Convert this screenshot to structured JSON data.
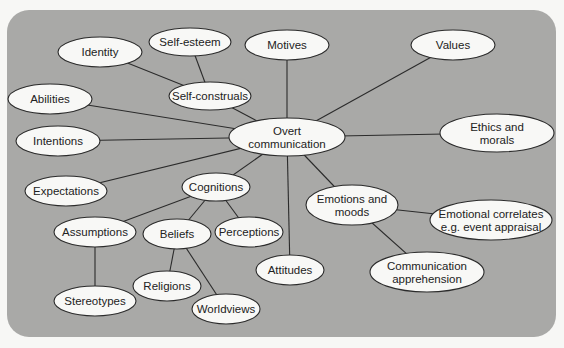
{
  "diagram": {
    "title": "",
    "colors": {
      "panel": "#a9a9a7",
      "page": "#f7f7f5",
      "node_fill": "#f8f8f6",
      "stroke": "#2b2b2b"
    },
    "nodes": [
      {
        "id": "overt",
        "lines": [
          "Overt",
          "communication"
        ],
        "cx": 287,
        "cy": 137,
        "rx": 58,
        "ry": 19
      },
      {
        "id": "identity",
        "lines": [
          "Identity"
        ],
        "cx": 100,
        "cy": 52,
        "rx": 42,
        "ry": 15
      },
      {
        "id": "selfesteem",
        "lines": [
          "Self-esteem"
        ],
        "cx": 190,
        "cy": 42,
        "rx": 41,
        "ry": 14
      },
      {
        "id": "motives",
        "lines": [
          "Motives"
        ],
        "cx": 287,
        "cy": 45,
        "rx": 42,
        "ry": 15
      },
      {
        "id": "values",
        "lines": [
          "Values"
        ],
        "cx": 453,
        "cy": 45,
        "rx": 42,
        "ry": 15
      },
      {
        "id": "selfconstruals",
        "lines": [
          "Self-construals"
        ],
        "cx": 210,
        "cy": 96,
        "rx": 41,
        "ry": 14
      },
      {
        "id": "abilities",
        "lines": [
          "Abilities"
        ],
        "cx": 50,
        "cy": 99,
        "rx": 42,
        "ry": 15
      },
      {
        "id": "intentions",
        "lines": [
          "Intentions"
        ],
        "cx": 58,
        "cy": 141,
        "rx": 42,
        "ry": 15
      },
      {
        "id": "ethics",
        "lines": [
          "Ethics and",
          "morals"
        ],
        "cx": 497,
        "cy": 133,
        "rx": 57,
        "ry": 19
      },
      {
        "id": "expectations",
        "lines": [
          "Expectations"
        ],
        "cx": 66,
        "cy": 191,
        "rx": 41,
        "ry": 15
      },
      {
        "id": "cognitions",
        "lines": [
          "Cognitions"
        ],
        "cx": 216,
        "cy": 187,
        "rx": 34,
        "ry": 14
      },
      {
        "id": "assumptions",
        "lines": [
          "Assumptions"
        ],
        "cx": 95,
        "cy": 232,
        "rx": 41,
        "ry": 15
      },
      {
        "id": "beliefs",
        "lines": [
          "Beliefs"
        ],
        "cx": 177,
        "cy": 234,
        "rx": 34,
        "ry": 15
      },
      {
        "id": "perceptions",
        "lines": [
          "Perceptions"
        ],
        "cx": 249,
        "cy": 232,
        "rx": 34,
        "ry": 15
      },
      {
        "id": "emotions",
        "lines": [
          "Emotions and",
          "moods"
        ],
        "cx": 352,
        "cy": 205,
        "rx": 46,
        "ry": 20
      },
      {
        "id": "emocorrelates",
        "lines": [
          "Emotional correlates",
          "e.g. event appraisal"
        ],
        "cx": 491,
        "cy": 220,
        "rx": 61,
        "ry": 20
      },
      {
        "id": "attitudes",
        "lines": [
          "Attitudes"
        ],
        "cx": 290,
        "cy": 270,
        "rx": 34,
        "ry": 15
      },
      {
        "id": "apprehension",
        "lines": [
          "Communication",
          "apprehension"
        ],
        "cx": 427,
        "cy": 272,
        "rx": 57,
        "ry": 20
      },
      {
        "id": "religions",
        "lines": [
          "Religions"
        ],
        "cx": 167,
        "cy": 286,
        "rx": 34,
        "ry": 15
      },
      {
        "id": "stereotypes",
        "lines": [
          "Stereotypes"
        ],
        "cx": 95,
        "cy": 301,
        "rx": 41,
        "ry": 15
      },
      {
        "id": "worldviews",
        "lines": [
          "Worldviews"
        ],
        "cx": 226,
        "cy": 309,
        "rx": 34,
        "ry": 15
      }
    ],
    "edges": [
      [
        "identity",
        "selfconstruals"
      ],
      [
        "selfesteem",
        "selfconstruals"
      ],
      [
        "selfconstruals",
        "overt"
      ],
      [
        "motives",
        "overt"
      ],
      [
        "values",
        "overt"
      ],
      [
        "abilities",
        "overt"
      ],
      [
        "intentions",
        "overt"
      ],
      [
        "ethics",
        "overt"
      ],
      [
        "expectations",
        "overt"
      ],
      [
        "cognitions",
        "overt"
      ],
      [
        "attitudes",
        "overt"
      ],
      [
        "emotions",
        "overt"
      ],
      [
        "cognitions",
        "assumptions"
      ],
      [
        "cognitions",
        "beliefs"
      ],
      [
        "cognitions",
        "perceptions"
      ],
      [
        "assumptions",
        "stereotypes"
      ],
      [
        "beliefs",
        "religions"
      ],
      [
        "beliefs",
        "worldviews"
      ],
      [
        "emotions",
        "emocorrelates"
      ],
      [
        "emotions",
        "apprehension"
      ]
    ]
  }
}
